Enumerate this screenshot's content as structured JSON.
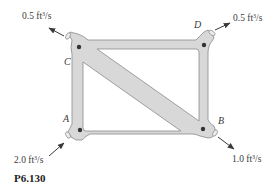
{
  "figure": {
    "caption": "P6.130",
    "frame_fill": "#d8d8d8",
    "frame_stroke": "#8a8a8a",
    "nodes": [
      {
        "id": "A",
        "label": "A"
      },
      {
        "id": "B",
        "label": "B"
      },
      {
        "id": "C",
        "label": "C"
      },
      {
        "id": "D",
        "label": "D"
      }
    ],
    "flows": [
      {
        "node": "C",
        "value": "0.5",
        "unit_pre": "ft",
        "unit_exp": "3",
        "unit_post": "/s",
        "direction": "out"
      },
      {
        "node": "D",
        "value": "0.5",
        "unit_pre": "ft",
        "unit_exp": "3",
        "unit_post": "/s",
        "direction": "out"
      },
      {
        "node": "A",
        "value": "2.0",
        "unit_pre": "ft",
        "unit_exp": "3",
        "unit_post": "/s",
        "direction": "in"
      },
      {
        "node": "B",
        "value": "1.0",
        "unit_pre": "ft",
        "unit_exp": "3",
        "unit_post": "/s",
        "direction": "out"
      }
    ]
  }
}
